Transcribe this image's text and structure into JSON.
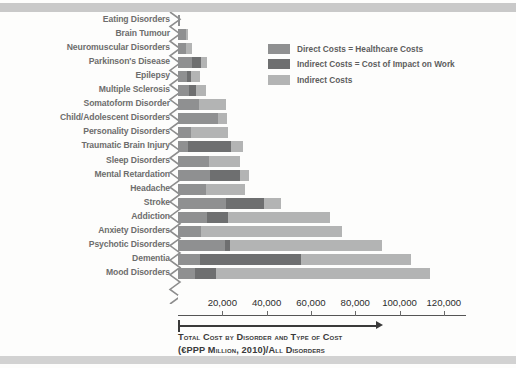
{
  "legend": {
    "items": [
      {
        "label": "Direct Costs = Healthcare Costs",
        "color": "#8f9091",
        "name": "direct-costs"
      },
      {
        "label": "Indirect Costs = Cost of Impact on Work",
        "color": "#6e6f70",
        "name": "indirect-costs-work"
      },
      {
        "label": "Indirect Costs",
        "color": "#b3b4b4",
        "name": "indirect-costs"
      }
    ]
  },
  "caption": {
    "line1": "Total Cost by Disorder and Type of Cost",
    "line2": "(€PPP Million, 2010)/All Disorders"
  },
  "axis": {
    "ticks": [
      "20,000",
      "40,000",
      "60,000",
      "80,000",
      "100,000",
      "120,000"
    ],
    "tick_values": [
      20000,
      40000,
      60000,
      80000,
      100000,
      120000
    ]
  },
  "chart_data": {
    "type": "bar",
    "orientation": "horizontal",
    "stacked": true,
    "title": "Total Cost by Disorder and Type of Cost",
    "subtitle": "(€PPP Million, 2010)/All Disorders",
    "xlabel": "€PPP Million, 2010",
    "ylabel": "",
    "xlim": [
      0,
      130000
    ],
    "grid": false,
    "legend_position": "top-right",
    "categories": [
      "Eating Disorders",
      "Brain Tumour",
      "Neuromuscular Disorders",
      "Parkinson's Disease",
      "Epilepsy",
      "Multiple Sclerosis",
      "Somatoform Disorder",
      "Child/Adolescent Disorders",
      "Personality Disorders",
      "Traumatic Brain Injury",
      "Sleep Disorders",
      "Mental Retardation",
      "Headache",
      "Stroke",
      "Addiction",
      "Anxiety Disorders",
      "Psychotic Disorders",
      "Dementia",
      "Mood Disorders"
    ],
    "series": [
      {
        "name": "Direct Costs = Healthcare Costs",
        "color": "#8f9091",
        "values": [
          800,
          3600,
          3600,
          6200,
          4000,
          4900,
          9400,
          17900,
          5900,
          4500,
          13800,
          14400,
          12800,
          21700,
          13300,
          10600,
          21300,
          10100,
          7800
        ]
      },
      {
        "name": "Indirect Costs = Cost of Impact on Work",
        "color": "#6e6f70",
        "values": [
          0,
          0,
          0,
          4100,
          2000,
          3400,
          0,
          0,
          0,
          19400,
          0,
          13600,
          0,
          17100,
          9200,
          0,
          2000,
          45500,
          9300
        ]
      },
      {
        "name": "Indirect Costs",
        "color": "#b3b4b4",
        "values": [
          0,
          1000,
          2900,
          2900,
          4000,
          4400,
          12200,
          4400,
          16600,
          5300,
          14400,
          4200,
          17400,
          7600,
          45900,
          63400,
          68700,
          49400,
          96500
        ]
      }
    ],
    "totals": [
      800,
      4600,
      6500,
      13200,
      10000,
      12700,
      21600,
      22300,
      22500,
      29200,
      28200,
      32200,
      30200,
      46400,
      68400,
      74000,
      92000,
      105000,
      113600
    ]
  }
}
